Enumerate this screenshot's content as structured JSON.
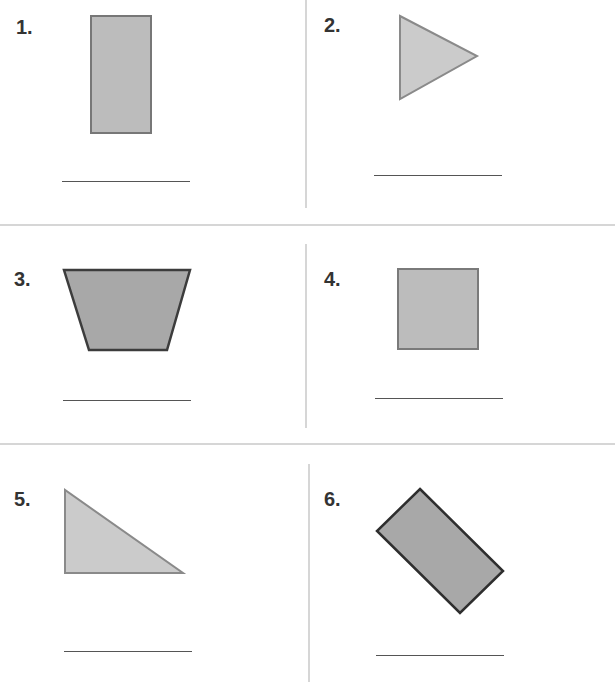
{
  "worksheet": {
    "items": [
      {
        "number": "1.",
        "shape": "rectangle",
        "fill": "#bcbcbc",
        "stroke": "#777777"
      },
      {
        "number": "2.",
        "shape": "triangle",
        "fill": "#cbcbcb",
        "stroke": "#8a8a8a"
      },
      {
        "number": "3.",
        "shape": "trapezoid",
        "fill": "#a8a8a8",
        "stroke": "#3c3c3c"
      },
      {
        "number": "4.",
        "shape": "square",
        "fill": "#bcbcbc",
        "stroke": "#7a7a7a"
      },
      {
        "number": "5.",
        "shape": "right-triangle",
        "fill": "#cbcbcb",
        "stroke": "#8a8a8a"
      },
      {
        "number": "6.",
        "shape": "rotated-rectangle",
        "fill": "#a8a8a8",
        "stroke": "#2e2e2e"
      }
    ]
  }
}
